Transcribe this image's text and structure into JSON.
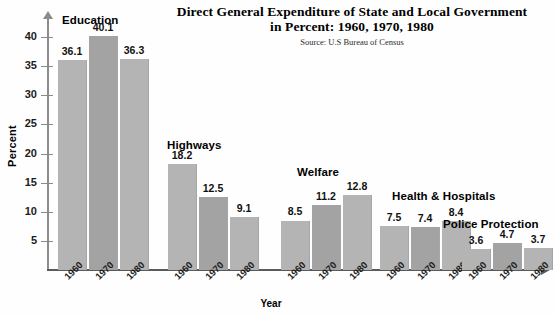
{
  "header": {
    "title_line1": "Direct General Expenditure of State and Local Government",
    "title_line2": "in Percent: 1960, 1970, 1980",
    "source": "Source: U.S Bureau of Census"
  },
  "axes": {
    "ylabel": "Percent",
    "xlabel": "Year",
    "yticks": [
      "5",
      "10",
      "15",
      "20",
      "25",
      "30",
      "35",
      "40"
    ]
  },
  "chart_data": {
    "type": "bar",
    "title": "Direct General Expenditure of State and Local Government in Percent: 1960, 1970, 1980",
    "subtitle": "Source: U.S Bureau of Census",
    "xlabel": "Year",
    "ylabel": "Percent",
    "ylim": [
      0,
      42
    ],
    "yticks": [
      5,
      10,
      15,
      20,
      25,
      30,
      35,
      40
    ],
    "grid": false,
    "legend": "none",
    "categories": [
      "Education",
      "Highways",
      "Welfare",
      "Health & Hospitals",
      "Police Protection"
    ],
    "x": [
      "1960",
      "1970",
      "1980"
    ],
    "series": [
      {
        "name": "1960",
        "values": [
          36.1,
          18.2,
          8.5,
          7.5,
          3.6
        ]
      },
      {
        "name": "1970",
        "values": [
          40.1,
          12.5,
          11.2,
          7.4,
          4.7
        ]
      },
      {
        "name": "1980",
        "values": [
          36.3,
          9.1,
          12.8,
          8.4,
          3.7
        ]
      }
    ],
    "groups": [
      {
        "label": "Education",
        "bars": [
          {
            "year": "1960",
            "value": "36.1"
          },
          {
            "year": "1970",
            "value": "40.1"
          },
          {
            "year": "1980",
            "value": "36.3"
          }
        ]
      },
      {
        "label": "Highways",
        "bars": [
          {
            "year": "1960",
            "value": "18.2"
          },
          {
            "year": "1970",
            "value": "12.5"
          },
          {
            "year": "1980",
            "value": "9.1"
          }
        ]
      },
      {
        "label": "Welfare",
        "bars": [
          {
            "year": "1960",
            "value": "8.5"
          },
          {
            "year": "1970",
            "value": "11.2"
          },
          {
            "year": "1980",
            "value": "12.8"
          }
        ]
      },
      {
        "label": "Health & Hospitals",
        "bars": [
          {
            "year": "1960",
            "value": "7.5"
          },
          {
            "year": "1970",
            "value": "7.4"
          },
          {
            "year": "1980",
            "value": "8.4"
          }
        ]
      },
      {
        "label": "Police Protection",
        "bars": [
          {
            "year": "1960",
            "value": "3.6"
          },
          {
            "year": "1970",
            "value": "4.7"
          },
          {
            "year": "1980",
            "value": "3.7"
          }
        ]
      }
    ],
    "colors": {
      "bar_light": "#b4b4b4",
      "bar_dark": "#a3a3a3",
      "axis": "#5a5a5a",
      "text": "#111111",
      "background": "#fefefe"
    }
  }
}
